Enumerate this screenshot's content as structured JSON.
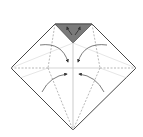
{
  "diagram": {
    "type": "origami-fold-step",
    "paper_outline_color": "#333333",
    "flap_fill_color": "#7a7a7a",
    "crease_color": "#999999",
    "arrow_color": "#444444",
    "elements": {
      "outline": "pentagon-diamond paper shape",
      "top_flap": "grey triangular flap at top",
      "creases": [
        "vertical center crease",
        "horizontal center crease",
        "diagonal valley folds"
      ],
      "arrows": [
        "upper-left curved arrow",
        "upper-right curved arrow",
        "lower-left curved arrow",
        "lower-right curved arrow",
        "top flap arrows"
      ]
    }
  }
}
